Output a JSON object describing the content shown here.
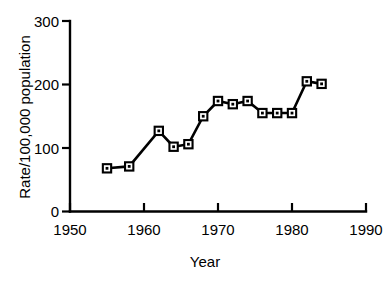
{
  "chart_data": {
    "type": "line",
    "title": "",
    "subtitle": "",
    "xlabel": "Year",
    "ylabel": "Rate/100,000 population",
    "xlim": [
      1950,
      1990
    ],
    "ylim": [
      0,
      300
    ],
    "xticks": [
      1950,
      1960,
      1970,
      1980,
      1990
    ],
    "xticklabels": [
      "1950",
      "1960",
      "1970",
      "1980",
      "1990"
    ],
    "yticks": [
      0,
      100,
      200,
      300
    ],
    "yticklabels": [
      "0",
      "100",
      "200",
      "300"
    ],
    "grid": false,
    "legend": false,
    "legend_position": "none",
    "marker": "square",
    "line_color": "#000000",
    "marker_color": "#000000",
    "x": [
      1955,
      1958,
      1962,
      1964,
      1966,
      1968,
      1970,
      1972,
      1974,
      1976,
      1978,
      1980,
      1982,
      1984
    ],
    "values": [
      68,
      71,
      127,
      102,
      106,
      150,
      174,
      169,
      174,
      155,
      155,
      155,
      205,
      201
    ],
    "series": [
      {
        "name": "Rate",
        "x": [
          1955,
          1958,
          1962,
          1964,
          1966,
          1968,
          1970,
          1972,
          1974,
          1976,
          1978,
          1980,
          1982,
          1984
        ],
        "values": [
          68,
          71,
          127,
          102,
          106,
          150,
          174,
          169,
          174,
          155,
          155,
          155,
          205,
          201
        ]
      }
    ],
    "annotations": []
  }
}
